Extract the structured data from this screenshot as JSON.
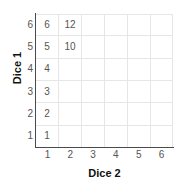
{
  "chart_data": {
    "type": "table",
    "title": "",
    "xlabel": "Dice 2",
    "ylabel": "Dice 1",
    "x_ticks": [
      "1",
      "2",
      "3",
      "4",
      "5",
      "6"
    ],
    "y_ticks": [
      "6",
      "5",
      "4",
      "3",
      "2",
      "1"
    ],
    "xlim": [
      1,
      6
    ],
    "ylim": [
      1,
      6
    ],
    "grid": true,
    "legend": false,
    "row_labels": [
      "6",
      "5",
      "4",
      "3",
      "2",
      "1"
    ],
    "column_labels": [
      "1",
      "2",
      "3",
      "4",
      "5",
      "6"
    ],
    "cells": [
      [
        "6",
        "12",
        "",
        "",
        "",
        ""
      ],
      [
        "5",
        "10",
        "",
        "",
        "",
        ""
      ],
      [
        "4",
        "",
        "",
        "",
        "",
        ""
      ],
      [
        "3",
        "",
        "",
        "",
        "",
        ""
      ],
      [
        "2",
        "",
        "",
        "",
        "",
        ""
      ],
      [
        "1",
        "",
        "",
        "",
        "",
        ""
      ]
    ]
  },
  "colors": {
    "background": "#ffffff",
    "gridline": "#e6e6e6",
    "axis_line": "#4a4a4a",
    "cell_text": "#555555",
    "tick_text": "#555555",
    "axis_title": "#111111"
  }
}
